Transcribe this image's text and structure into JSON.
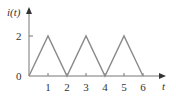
{
  "chart_data": {
    "type": "line",
    "title": "",
    "xlabel": "t",
    "ylabel": "i(t)",
    "x": [
      0,
      1,
      2,
      3,
      4,
      5,
      6
    ],
    "series": [
      {
        "name": "i(t)",
        "values": [
          0,
          2,
          0,
          2,
          0,
          2,
          0
        ]
      }
    ],
    "xticks": [
      "1",
      "2",
      "3",
      "4",
      "5",
      "6"
    ],
    "yticks": [
      "0",
      "2"
    ],
    "xlim": [
      0,
      6.8
    ],
    "ylim": [
      0,
      2.8
    ],
    "grid": false,
    "legend": "none"
  },
  "colors": {
    "series": "#8a8a8a",
    "axis": "#777777",
    "text": "#333333"
  }
}
